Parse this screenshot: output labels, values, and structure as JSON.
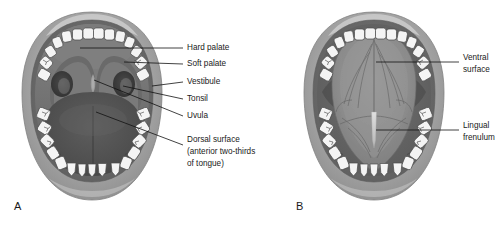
{
  "figure": {
    "type": "anatomical-illustration",
    "background_color": "#ffffff",
    "text_color": "#1a1a1a",
    "leader_line_color": "#111111"
  },
  "panels": [
    {
      "id": "A",
      "letter": "A",
      "view": "Mouth open, tongue flat — dorsal view of oral cavity",
      "labels": [
        {
          "id": "hard-palate",
          "text": "Hard palate",
          "text2": "",
          "text3": ""
        },
        {
          "id": "soft-palate",
          "text": "Soft palate",
          "text2": "",
          "text3": ""
        },
        {
          "id": "vestibule",
          "text": "Vestibule",
          "text2": "",
          "text3": ""
        },
        {
          "id": "tonsil",
          "text": "Tonsil",
          "text2": "",
          "text3": ""
        },
        {
          "id": "uvula",
          "text": "Uvula",
          "text2": "",
          "text3": ""
        },
        {
          "id": "dorsal-surface",
          "text": "Dorsal surface",
          "text2": "(anterior two-thirds",
          "text3": "of tongue)"
        }
      ]
    },
    {
      "id": "B",
      "letter": "B",
      "view": "Tongue raised — ventral view of tongue underside",
      "labels": [
        {
          "id": "ventral-surface",
          "text": "Ventral",
          "text2": "surface",
          "text3": ""
        },
        {
          "id": "lingual-frenulum",
          "text": "Lingual",
          "text2": "frenulum",
          "text3": ""
        }
      ]
    }
  ],
  "colors": {
    "lip_outer": "#9a9a9a",
    "lip_mid": "#b4b4b4",
    "lip_highlight": "#cfcfcf",
    "vestibule_dark": "#6e6e6e",
    "palate": "#787878",
    "oral_cavity_dark": "#4a4a4a",
    "tongue_dorsal": "#585858",
    "tongue_ventral": "#8a8a8a",
    "tooth_fill": "#f4f4f4",
    "tooth_stroke": "#4a4a4a",
    "tonsil": "#3d3d3d",
    "frenulum": "#d8d8d8"
  }
}
